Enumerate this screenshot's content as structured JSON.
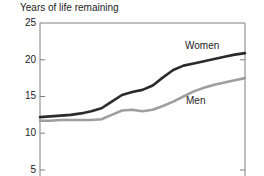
{
  "chart_data": {
    "type": "line",
    "title": "Years of life remaining",
    "xlabel": "",
    "ylabel": "",
    "ylim": [
      5,
      25
    ],
    "yticks": [
      25,
      20,
      15,
      10,
      5
    ],
    "ytick_labels": [
      "25",
      "20",
      "15",
      "10",
      "5"
    ],
    "grid": false,
    "legend_position": "inline-annotation",
    "axis_note": "bottom of plot area is cropped below the image edge; x axis has no visible tick labels",
    "x": [
      0,
      5,
      10,
      15,
      20,
      25,
      30,
      35,
      40,
      45,
      50,
      55,
      60,
      65,
      70,
      75,
      80,
      85,
      90,
      95,
      100
    ],
    "series": [
      {
        "name": "Women",
        "color": "#2b2b2b",
        "values": [
          12.2,
          12.3,
          12.4,
          12.5,
          12.7,
          13.0,
          13.4,
          14.3,
          15.2,
          15.6,
          15.9,
          16.5,
          17.6,
          18.6,
          19.2,
          19.5,
          19.8,
          20.1,
          20.4,
          20.7,
          20.9
        ]
      },
      {
        "name": "Men",
        "color": "#9e9e9e",
        "values": [
          11.7,
          11.7,
          11.8,
          11.8,
          11.8,
          11.8,
          11.9,
          12.5,
          13.1,
          13.2,
          13.0,
          13.2,
          13.7,
          14.3,
          15.0,
          15.7,
          16.2,
          16.6,
          16.9,
          17.2,
          17.5
        ]
      }
    ],
    "annotations": [
      {
        "text": "Women",
        "series": "Women"
      },
      {
        "text": "Men",
        "series": "Men"
      }
    ]
  },
  "colors": {
    "axis": "#808080",
    "women_line": "#2b2b2b",
    "men_line": "#9e9e9e",
    "text": "#222222",
    "background": "#ffffff"
  }
}
